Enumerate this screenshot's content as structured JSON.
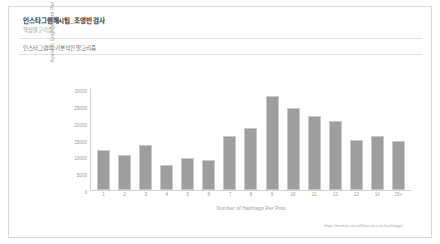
{
  "document": {
    "title": "인스타그램해시팁_조영빈 검사",
    "subtitle": "핵심알고리즘",
    "caption": "인스타그램의 기본적인 알고리즘"
  },
  "chart_data": {
    "type": "bar",
    "title": "",
    "xlabel": "Number of Hashtags Per Post",
    "ylabel": "Average Engagement Per Post",
    "categories": [
      "1",
      "2",
      "3",
      "4",
      "5",
      "6",
      "7",
      "8",
      "9",
      "10",
      "11",
      "12",
      "13",
      "14",
      "15+"
    ],
    "values": [
      12000,
      10500,
      13500,
      7500,
      9500,
      9000,
      16000,
      18500,
      28000,
      24500,
      22000,
      20500,
      15000,
      16000,
      14500
    ],
    "ylim": [
      0,
      30000
    ],
    "yticks": [
      0,
      5000,
      10000,
      15000,
      20000,
      25000,
      30000
    ],
    "ytick_labels": [
      "0",
      "5000",
      "10000",
      "15000",
      "20000",
      "25000",
      "30000"
    ],
    "grid": false,
    "legend": false,
    "bar_color": "#9e9e9e",
    "axis_color": "#d2d2d2",
    "text_color": "#9a9a9a"
  },
  "source": {
    "url": "https://revive.social/how-to-use-hashtags/"
  }
}
